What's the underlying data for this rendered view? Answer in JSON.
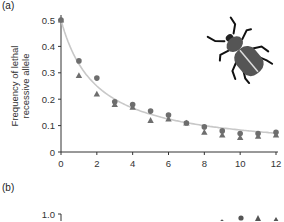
{
  "panels": {
    "a_label": "(a)",
    "b_label": "(b)"
  },
  "chart_data": [
    {
      "type": "scatter",
      "panel": "(a)",
      "title": "",
      "xlabel": "",
      "ylabel": "Frequency of lethal recessive allele",
      "ylabel_lines": [
        "Frequency of lethal",
        "recessive allele"
      ],
      "xlim": [
        0,
        12
      ],
      "ylim": [
        0,
        0.5
      ],
      "xticks": [
        0,
        2,
        4,
        6,
        8,
        10,
        12
      ],
      "yticks": [
        0,
        0.1,
        0.2,
        0.3,
        0.4,
        0.5
      ],
      "xtick_labels": [
        "0",
        "2",
        "4",
        "6",
        "8",
        "10",
        "12"
      ],
      "ytick_labels": [
        "0",
        "0.1",
        "0.2",
        "0.3",
        "0.4",
        "0.5"
      ],
      "grid": false,
      "legend": null,
      "x": [
        0,
        1,
        2,
        3,
        4,
        5,
        6,
        7,
        8,
        9,
        10,
        11,
        12
      ],
      "series": [
        {
          "name": "circles",
          "marker": "circle",
          "color": "#6e6e6e",
          "values": [
            0.5,
            0.345,
            0.28,
            0.19,
            0.18,
            0.155,
            0.14,
            0.11,
            0.095,
            0.08,
            0.07,
            0.07,
            0.075
          ]
        },
        {
          "name": "triangles",
          "marker": "triangle",
          "color": "#6e6e6e",
          "values": [
            0.5,
            0.29,
            0.22,
            0.18,
            0.17,
            0.12,
            0.125,
            0.11,
            0.075,
            0.065,
            0.055,
            0.06,
            0.065
          ]
        },
        {
          "name": "theoretical curve",
          "marker": "line",
          "color": "#c8c8c8",
          "values": [
            0.5,
            0.333,
            0.25,
            0.2,
            0.167,
            0.143,
            0.125,
            0.111,
            0.1,
            0.091,
            0.083,
            0.077,
            0.071
          ]
        }
      ],
      "annotations": [
        "beetle-icon"
      ]
    },
    {
      "type": "scatter",
      "panel": "(b)",
      "yticks_visible": [
        1.0
      ],
      "ytick_labels": [
        "1.0"
      ],
      "note": "panel cropped; only top of axis and a few points visible"
    }
  ]
}
